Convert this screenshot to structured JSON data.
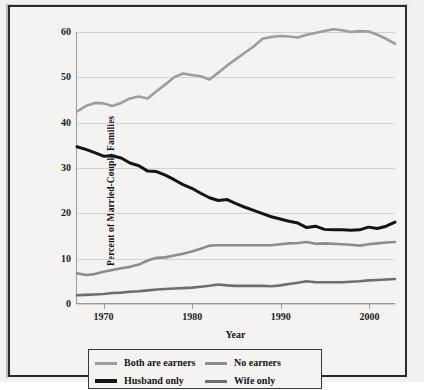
{
  "chart_data": {
    "type": "line",
    "title": "",
    "xlabel": "Year",
    "ylabel": "Percent of Married-Couple Families",
    "xlim": [
      1967,
      2003
    ],
    "ylim": [
      0,
      60
    ],
    "yticks": [
      0,
      10,
      20,
      30,
      40,
      50,
      60
    ],
    "xticks": [
      1970,
      1980,
      1990,
      2000
    ],
    "grid": true,
    "legend_position": "below-outside",
    "x": [
      1967,
      1968,
      1969,
      1970,
      1971,
      1972,
      1973,
      1974,
      1975,
      1976,
      1977,
      1978,
      1979,
      1980,
      1981,
      1982,
      1983,
      1984,
      1985,
      1986,
      1987,
      1988,
      1989,
      1990,
      1991,
      1992,
      1993,
      1994,
      1995,
      1996,
      1997,
      1998,
      1999,
      2000,
      2001,
      2002,
      2003
    ],
    "series": [
      {
        "name": "Both are earners",
        "color": "#9d9d9d",
        "width": 2.6,
        "values": [
          42.4,
          43.6,
          44.3,
          44.2,
          43.6,
          44.3,
          45.3,
          45.7,
          45.3,
          46.9,
          48.4,
          50.0,
          50.8,
          50.5,
          50.2,
          49.5,
          51.0,
          52.6,
          54.0,
          55.4,
          56.8,
          58.5,
          58.9,
          59.1,
          59.0,
          58.8,
          59.4,
          59.8,
          60.2,
          60.6,
          60.4,
          60.0,
          60.2,
          60.1,
          59.4,
          58.5,
          57.4
        ]
      },
      {
        "name": "Husband only",
        "color": "#141414",
        "width": 3.0,
        "values": [
          34.6,
          34.0,
          33.3,
          32.5,
          32.6,
          32.1,
          31.0,
          30.4,
          29.2,
          29.1,
          28.3,
          27.3,
          26.2,
          25.4,
          24.3,
          23.3,
          22.7,
          22.9,
          22.0,
          21.2,
          20.5,
          19.8,
          19.1,
          18.6,
          18.1,
          17.7,
          16.7,
          17.0,
          16.3,
          16.2,
          16.2,
          16.1,
          16.2,
          16.8,
          16.5,
          17.0,
          17.9
        ]
      },
      {
        "name": "No earners",
        "color": "#8c8c8c",
        "width": 2.6,
        "values": [
          6.6,
          6.2,
          6.4,
          6.9,
          7.3,
          7.7,
          8.0,
          8.5,
          9.4,
          10.0,
          10.1,
          10.5,
          10.9,
          11.4,
          12.0,
          12.7,
          12.8,
          12.8,
          12.8,
          12.8,
          12.8,
          12.8,
          12.8,
          13.0,
          13.2,
          13.3,
          13.5,
          13.1,
          13.2,
          13.1,
          13.0,
          12.9,
          12.7,
          13.0,
          13.2,
          13.4,
          13.5
        ]
      },
      {
        "name": "Wife only",
        "color": "#6e6e6e",
        "width": 2.6,
        "values": [
          1.7,
          1.8,
          1.9,
          2.0,
          2.2,
          2.3,
          2.5,
          2.6,
          2.8,
          3.0,
          3.1,
          3.2,
          3.3,
          3.4,
          3.6,
          3.8,
          4.1,
          3.9,
          3.8,
          3.8,
          3.8,
          3.8,
          3.7,
          3.9,
          4.2,
          4.5,
          4.8,
          4.6,
          4.6,
          4.6,
          4.6,
          4.7,
          4.8,
          5.0,
          5.1,
          5.2,
          5.3
        ]
      }
    ]
  },
  "axes": {
    "y_title": "Percent of Married-Couple Families",
    "x_title": "Year",
    "y_tick_labels": [
      "60",
      "50",
      "40",
      "30",
      "20",
      "10",
      "0"
    ],
    "x_tick_labels": [
      "1970",
      "1980",
      "1990",
      "2000"
    ]
  },
  "legend": {
    "entries": [
      {
        "label": "Both are earners",
        "color": "#9d9d9d"
      },
      {
        "label": "No earners",
        "color": "#8c8c8c"
      },
      {
        "label": "Husband only",
        "color": "#141414"
      },
      {
        "label": "Wife only",
        "color": "#6e6e6e"
      }
    ]
  }
}
